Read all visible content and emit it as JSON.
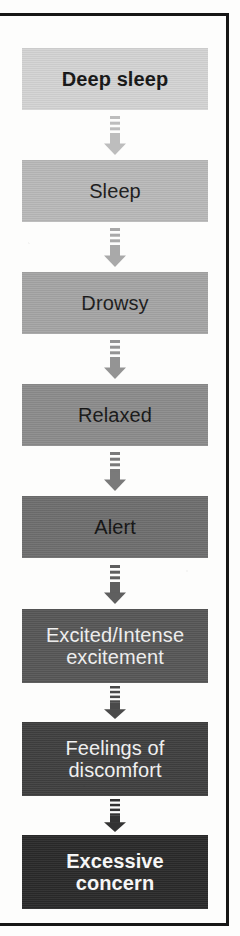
{
  "figure": {
    "orientation": "vertical-top-to-bottom",
    "frame_color": "#161616",
    "background_color": "#fdfdfc",
    "arrow_icon_name": "down-arrow-icon",
    "arrow_color_note": "arrow shade matches the block immediately below it"
  },
  "chart_data": {
    "type": "diagram",
    "node_count": 8,
    "connector_count": 7,
    "connector_type": "striped-shaft-down-arrow"
  },
  "steps": [
    {
      "label": "Deep sleep",
      "lines": [
        "Deep sleep"
      ],
      "fill": "#d4d4d4",
      "text_color": "#141414",
      "bold": true,
      "font_size": 20,
      "top": 48,
      "height": 62
    },
    {
      "label": "Sleep",
      "lines": [
        "Sleep"
      ],
      "fill": "#b9b9b9",
      "text_color": "#1a1a1a",
      "bold": false,
      "font_size": 20,
      "top": 160,
      "height": 62
    },
    {
      "label": "Drowsy",
      "lines": [
        "Drowsy"
      ],
      "fill": "#a5a5a5",
      "text_color": "#1a1a1a",
      "bold": false,
      "font_size": 20,
      "top": 272,
      "height": 62
    },
    {
      "label": "Relaxed",
      "lines": [
        "Relaxed"
      ],
      "fill": "#8c8c8c",
      "text_color": "#151515",
      "bold": false,
      "font_size": 20,
      "top": 384,
      "height": 62
    },
    {
      "label": "Alert",
      "lines": [
        "Alert"
      ],
      "fill": "#6e6e6e",
      "text_color": "#111111",
      "bold": false,
      "font_size": 20,
      "top": 496,
      "height": 62
    },
    {
      "label": "Excited/Intense excitement",
      "lines": [
        "Excited/Intense",
        "excitement"
      ],
      "fill": "#575757",
      "text_color": "#f2f2f2",
      "bold": false,
      "font_size": 20,
      "top": 609,
      "height": 74
    },
    {
      "label": "Feelings of discomfort",
      "lines": [
        "Feelings of",
        "discomfort"
      ],
      "fill": "#3f3f3f",
      "text_color": "#f4f4f4",
      "bold": false,
      "font_size": 20,
      "top": 722,
      "height": 74
    },
    {
      "label": "Excessive concern",
      "lines": [
        "Excessive",
        "concern"
      ],
      "fill": "#2a2a2a",
      "text_color": "#fbfbfb",
      "bold": true,
      "font_size": 20,
      "top": 835,
      "height": 74
    }
  ],
  "arrows": [
    {
      "from": "Deep sleep",
      "to": "Sleep",
      "color": "#bdbdbd",
      "top": 114,
      "height": 42
    },
    {
      "from": "Sleep",
      "to": "Drowsy",
      "color": "#a9a9a9",
      "top": 226,
      "height": 42
    },
    {
      "from": "Drowsy",
      "to": "Relaxed",
      "color": "#949494",
      "top": 338,
      "height": 42
    },
    {
      "from": "Relaxed",
      "to": "Alert",
      "color": "#7a7a7a",
      "top": 450,
      "height": 42
    },
    {
      "from": "Alert",
      "to": "Excited/Intense excitement",
      "color": "#5f5f5f",
      "top": 563,
      "height": 42
    },
    {
      "from": "Excited/Intense excitement",
      "to": "Feelings of discomfort",
      "color": "#4a4a4a",
      "top": 684,
      "height": 36
    },
    {
      "from": "Feelings of discomfort",
      "to": "Excessive concern",
      "color": "#333333",
      "top": 797,
      "height": 36
    }
  ]
}
